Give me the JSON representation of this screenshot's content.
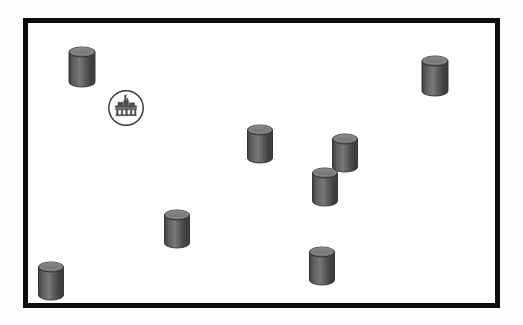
{
  "figure": {
    "kind": "site-map-diagram",
    "background_color": "#ffffff",
    "outer_background_color": "#fefefe"
  },
  "frame": {
    "name": "map-boundary-frame",
    "x": 23,
    "y": 18,
    "width": 477,
    "height": 290,
    "border_width": 5,
    "border_color": "#0d0d0d",
    "fill_color": "#ffffff"
  },
  "legend_colors": {
    "tank_body": "#5e5e5e",
    "tank_body_light": "#7a7a7a",
    "tank_body_dark": "#3f3f3f",
    "tank_top": "#6b6b6b",
    "tank_top_rim": "#8a8a8a",
    "tank_outline": "#2b2b2b",
    "badge_stroke": "#3a3a3a",
    "badge_fill": "#ffffff",
    "badge_symbol": "#4a4a4a"
  },
  "markers": {
    "tank_label": "storage-tank",
    "facility_label": "industrial-facility",
    "count_tanks": 9,
    "count_facilities": 1
  },
  "tanks": [
    {
      "id": "tank-1",
      "name": "storage-tank-upper-left",
      "x": 82,
      "y": 87,
      "w": 26,
      "h": 40
    },
    {
      "id": "tank-2",
      "name": "storage-tank-upper-right",
      "x": 435,
      "y": 96,
      "w": 26,
      "h": 40
    },
    {
      "id": "tank-3",
      "name": "storage-tank-center",
      "x": 260,
      "y": 163,
      "w": 25,
      "h": 38
    },
    {
      "id": "tank-4",
      "name": "storage-tank-center-right",
      "x": 345,
      "y": 172,
      "w": 25,
      "h": 38
    },
    {
      "id": "tank-5",
      "name": "storage-tank-mid-right",
      "x": 325,
      "y": 206,
      "w": 25,
      "h": 38
    },
    {
      "id": "tank-6",
      "name": "storage-tank-lower-center",
      "x": 177,
      "y": 248,
      "w": 25,
      "h": 38
    },
    {
      "id": "tank-7",
      "name": "storage-tank-lower-right",
      "x": 322,
      "y": 285,
      "w": 25,
      "h": 38
    },
    {
      "id": "tank-8",
      "name": "storage-tank-bottom-left",
      "x": 51,
      "y": 300,
      "w": 25,
      "h": 38
    }
  ],
  "facilities": [
    {
      "id": "facility-1",
      "name": "industrial-facility-badge",
      "x": 126,
      "y": 108,
      "r": 19
    }
  ]
}
